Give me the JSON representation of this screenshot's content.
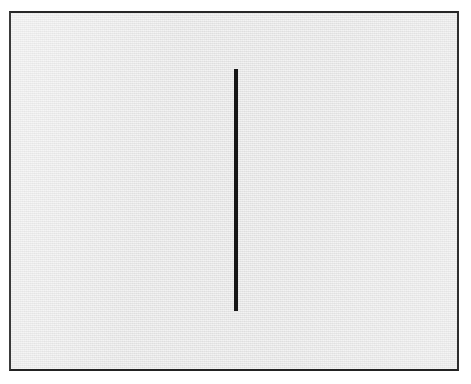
{
  "figure": {
    "kind": "line-drawing",
    "description": "Single vertical black line on a light gray rectangular field with a thin dark border",
    "canvas": {
      "width_px": 471,
      "height_px": 384,
      "background_color": "#ffffff"
    },
    "panel": {
      "name": "bordered-gray-field",
      "left_px": 9,
      "top_px": 11,
      "width_px": 450,
      "height_px": 360,
      "fill_color": "#e9e9e9",
      "border_color": "#2a2a2a",
      "border_width_px": 2,
      "texture": "scanned-paper-halftone"
    },
    "elements": [
      {
        "name": "vertical-line",
        "shape": "line",
        "orientation": "vertical",
        "stroke_color": "#161616",
        "left_px": 234,
        "top_px": 69,
        "width_px": 4,
        "height_px": 242,
        "center_x_px": 236,
        "center_y_px": 190,
        "x1_px": 236,
        "y1_px": 69,
        "x2_px": 236,
        "y2_px": 311
      }
    ],
    "labels": [],
    "caption": ""
  }
}
